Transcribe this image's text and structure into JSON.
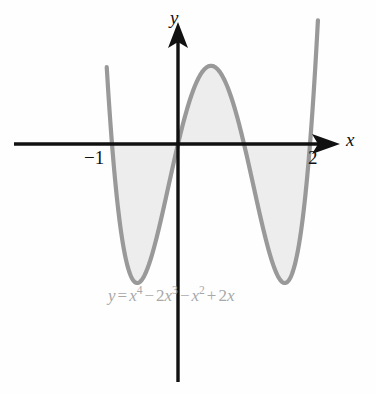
{
  "figure": {
    "kind": "cartesian-graph",
    "background_color": "#fefefe",
    "curve_color": "#999999",
    "fill_color": "#ededed",
    "axis_color": "#111111",
    "equation_color": "#a8a8a8"
  },
  "axes": {
    "x_axis_label": "x",
    "y_axis_label": "y",
    "x_ticks": [
      {
        "value": -1,
        "label": "−1"
      },
      {
        "value": 2,
        "label": "2"
      }
    ],
    "y_ticks": [],
    "grid": false,
    "x_arrow": true,
    "y_arrow": true
  },
  "equation": {
    "lhs": "y",
    "equals": "=",
    "term1_base": "x",
    "term1_exp": "4",
    "op1": "−",
    "term2_coef": "2",
    "term2_base": "x",
    "term2_exp": "3",
    "op2": "−",
    "term3_base": "x",
    "term3_exp": "2",
    "op3": "+",
    "term4_coef": "2",
    "term4_base": "x",
    "plain": "y = x⁴ − 2x³ − x² + 2x"
  },
  "chart_data": {
    "type": "line",
    "title": "",
    "subtitle": "",
    "xlabel": "x",
    "ylabel": "y",
    "legend": [
      "y = x⁴ − 2x³ − x² + 2x"
    ],
    "legend_position": "inside-bottom-center",
    "grid": false,
    "xlim": [
      -1.08,
      2.12
    ],
    "ylim": [
      -1.85,
      1.8
    ],
    "annotations": [
      "y = x⁴ − 2x³ − x² + 2x"
    ],
    "roots": [
      -1,
      0,
      1,
      2
    ],
    "shaded_regions": [
      {
        "from": -1,
        "to": 0,
        "sign": "negative"
      },
      {
        "from": 0,
        "to": 1,
        "sign": "positive"
      },
      {
        "from": 1,
        "to": 2,
        "sign": "negative"
      }
    ],
    "extrema": [
      {
        "type": "local-min",
        "x": -0.59,
        "y": -1.0
      },
      {
        "type": "local-max",
        "x": 0.5,
        "y": 0.56
      },
      {
        "type": "local-min",
        "x": 1.64,
        "y": -1.04
      }
    ],
    "x": [
      -1.08,
      -1.0,
      -0.9,
      -0.8,
      -0.7,
      -0.59,
      -0.5,
      -0.4,
      -0.3,
      -0.2,
      -0.1,
      0.0,
      0.1,
      0.2,
      0.3,
      0.4,
      0.5,
      0.6,
      0.7,
      0.8,
      0.9,
      1.0,
      1.1,
      1.2,
      1.3,
      1.4,
      1.5,
      1.64,
      1.7,
      1.8,
      1.9,
      2.0,
      2.12
    ],
    "y": [
      1.47,
      0.0,
      -0.55,
      -0.86,
      -0.99,
      -1.0,
      -0.94,
      -0.77,
      -0.55,
      -0.31,
      -0.1,
      0.0,
      0.18,
      0.32,
      0.44,
      0.52,
      0.56,
      0.54,
      0.46,
      0.32,
      0.13,
      0.0,
      -0.33,
      -0.67,
      -0.96,
      -1.1,
      -1.12,
      -1.04,
      -0.96,
      -0.65,
      -0.2,
      0.0,
      1.4
    ],
    "series": [
      {
        "name": "y = x⁴ − 2x³ − x² + 2x",
        "color": "#999999",
        "x": [
          -1.08,
          -1.0,
          -0.9,
          -0.8,
          -0.7,
          -0.59,
          -0.5,
          -0.4,
          -0.3,
          -0.2,
          -0.1,
          0.0,
          0.1,
          0.2,
          0.3,
          0.4,
          0.5,
          0.6,
          0.7,
          0.8,
          0.9,
          1.0,
          1.1,
          1.2,
          1.3,
          1.4,
          1.5,
          1.64,
          1.7,
          1.8,
          1.9,
          2.0,
          2.12
        ],
        "y": [
          1.47,
          0.0,
          -0.55,
          -0.86,
          -0.99,
          -1.0,
          -0.94,
          -0.77,
          -0.55,
          -0.31,
          -0.1,
          0.0,
          0.18,
          0.32,
          0.44,
          0.52,
          0.56,
          0.54,
          0.46,
          0.32,
          0.13,
          0.0,
          -0.33,
          -0.67,
          -0.96,
          -1.1,
          -1.12,
          -1.04,
          -0.96,
          -0.65,
          -0.2,
          0.0,
          1.4
        ]
      }
    ]
  }
}
